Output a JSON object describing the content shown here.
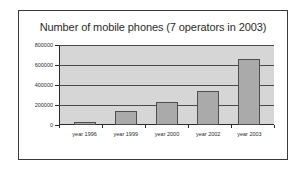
{
  "chart_data": {
    "type": "bar",
    "title": "Number of mobile phones (7 operators in 2003)",
    "xlabel": "",
    "ylabel": "",
    "categories": [
      "year 1996",
      "year 1999",
      "year 2000",
      "year 2002",
      "year 2003"
    ],
    "values": [
      28000,
      140000,
      230000,
      340000,
      660000
    ],
    "ylim": [
      0,
      800000
    ],
    "yticks": [
      0,
      200000,
      400000,
      600000,
      800000
    ],
    "ytick_labels": [
      "0",
      "200000",
      "400000",
      "600000",
      "800000"
    ],
    "grid": true,
    "legend": false,
    "colors": {
      "bar_fill": "#aaaaaa",
      "bar_border": "#4e4e4e",
      "plot_background": "#d6d6d6",
      "gridline": "#4a4a4a",
      "axis": "#2b2b2b",
      "frame_border": "#3a3a3a",
      "page_background": "#ffffff",
      "text": "#2b2b2b"
    }
  }
}
